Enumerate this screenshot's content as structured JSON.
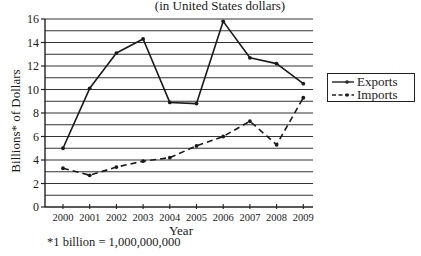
{
  "chart_data": {
    "type": "line",
    "title": "(in United States dollars)",
    "xlabel": "Year",
    "ylabel": "Billions* of Dollars",
    "footnote": "*1 billion = 1,000,000,000",
    "x": [
      "2000",
      "2001",
      "2002",
      "2003",
      "2004",
      "2005",
      "2006",
      "2007",
      "2008",
      "2009"
    ],
    "ylim": [
      0,
      16
    ],
    "yticks": [
      "0",
      "2",
      "4",
      "6",
      "8",
      "10",
      "12",
      "14",
      "16"
    ],
    "grid": "horizontal, every 1 unit",
    "legend_position": "right",
    "series": [
      {
        "name": "Exports",
        "style": "solid",
        "values": [
          5.0,
          10.1,
          13.1,
          14.3,
          8.9,
          8.8,
          15.8,
          12.7,
          12.2,
          10.5
        ]
      },
      {
        "name": "Imports",
        "style": "dashed",
        "values": [
          3.3,
          2.7,
          3.4,
          3.9,
          4.2,
          5.2,
          6.0,
          7.3,
          5.3,
          9.3
        ]
      }
    ]
  }
}
